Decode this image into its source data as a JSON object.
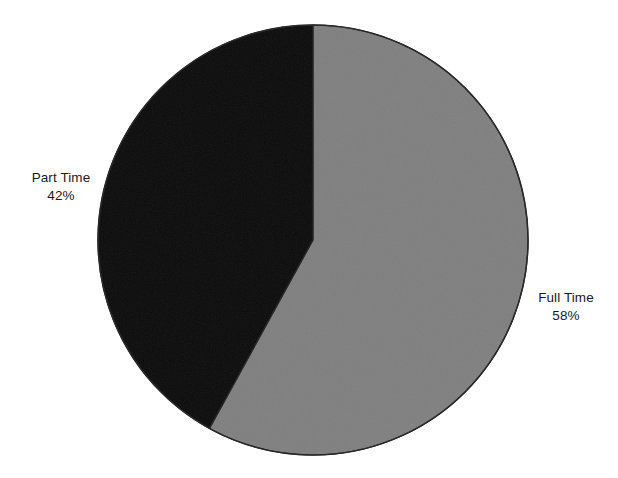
{
  "figure": {
    "background_color": "#ffffff",
    "width": 618,
    "height": 478
  },
  "chart_data": {
    "type": "pie",
    "title": "",
    "subtitle": "",
    "xlabel": "",
    "ylabel": "",
    "categories": [
      "Full Time",
      "Part Time"
    ],
    "values": [
      58,
      42
    ],
    "value_unit": "%",
    "labels": [
      "Full Time\n58%",
      "Part Time\n42%"
    ],
    "slices": [
      {
        "name": "Full Time",
        "value": 58,
        "value_label": "58%",
        "color": "#808080",
        "start_angle_deg": 0,
        "end_angle_deg": 208.8,
        "label_position": "right"
      },
      {
        "name": "Part Time",
        "value": 42,
        "value_label": "42%",
        "color": "#0d0d0d",
        "start_angle_deg": 208.8,
        "end_angle_deg": 360,
        "label_position": "left"
      }
    ],
    "start_angle_deg": 0,
    "direction": "clockwise",
    "legend": false,
    "legend_position": "none",
    "grid": false,
    "outline_color": "#262626",
    "outline_width": 1.5
  },
  "geometry": {
    "center_x": 313,
    "center_y": 240,
    "radius": 215
  },
  "labels": {
    "part_time": {
      "name": "Part Time",
      "value": "42%"
    },
    "full_time": {
      "name": "Full Time",
      "value": "58%"
    }
  }
}
